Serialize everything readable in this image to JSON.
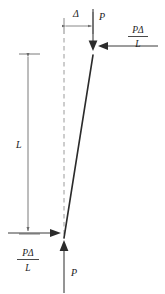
{
  "figure": {
    "type": "engineering-diagram",
    "colors": {
      "stroke": "#3a3a3a",
      "column": "#2b2b2b",
      "dashed": "#9a9a9a",
      "dimension": "#6b6b6b",
      "text": "#1a1a1a",
      "background": "#ffffff"
    }
  },
  "labels": {
    "delta": "Δ",
    "load_top": "P",
    "load_bottom": "P",
    "length": "L",
    "shear_top_numerator": "PΔ",
    "shear_top_denominator": "L",
    "shear_bottom_numerator": "PΔ",
    "shear_bottom_denominator": "L",
    "fraction_bar": "—"
  },
  "elements": {
    "deflection_dimension": {
      "name": "delta-dimension",
      "label": "Δ",
      "from_x": 64,
      "to_x": 93,
      "y": 26
    },
    "length_dimension": {
      "name": "length-dimension",
      "label": "L",
      "x": 28,
      "top_y": 54,
      "bottom_y": 234
    },
    "column": {
      "name": "buckled-column",
      "top_x": 93,
      "top_y": 55,
      "bottom_x": 64,
      "bottom_y": 237
    },
    "reference_axis": {
      "name": "undeformed-axis",
      "x": 64,
      "top_y": 38,
      "bottom_y": 237,
      "style": "dashed"
    },
    "top_load_arrow": {
      "name": "top-load-arrow",
      "direction": "down",
      "x": 93,
      "from_y": 10,
      "to_y": 50
    },
    "bottom_load_arrow": {
      "name": "bottom-load-arrow",
      "direction": "up",
      "x": 64,
      "from_y": 292,
      "to_y": 241
    },
    "top_shear_arrow": {
      "name": "top-shear-arrow",
      "direction": "left",
      "from_x": 158,
      "to_x": 99,
      "y": 46
    },
    "bottom_shear_arrow": {
      "name": "bottom-shear-arrow",
      "direction": "right",
      "from_x": 8,
      "to_x": 60,
      "y": 233
    }
  }
}
